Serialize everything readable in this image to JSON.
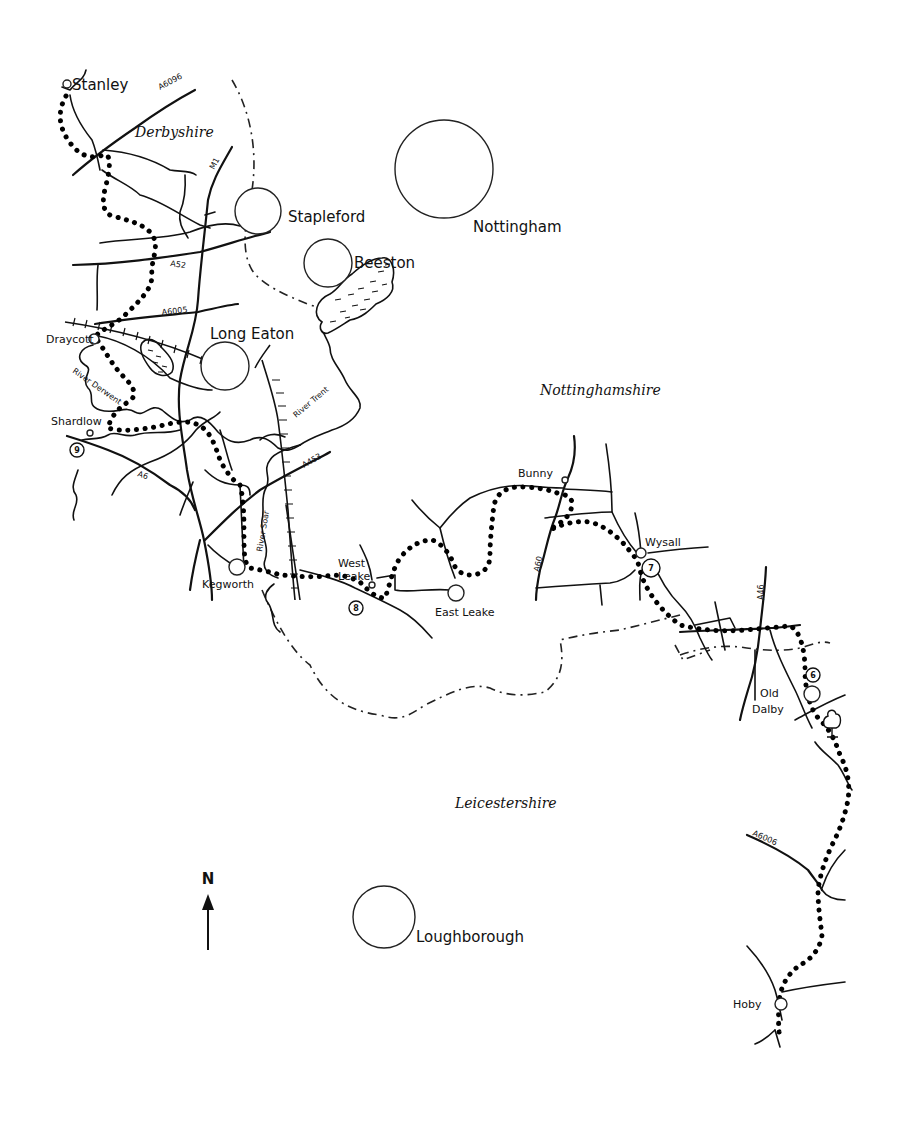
{
  "map": {
    "counties": {
      "derbyshire": "Derbyshire",
      "nottinghamshire": "Nottinghamshire",
      "leicestershire": "Leicestershire"
    },
    "towns": {
      "stanley": "Stanley",
      "stapleford": "Stapleford",
      "nottingham": "Nottingham",
      "beeston": "Beeston",
      "long_eaton": "Long Eaton",
      "draycott": "Draycott",
      "shardlow": "Shardlow",
      "kegworth": "Kegworth",
      "west_leake_1": "West",
      "west_leake_2": "Leake",
      "east_leake": "East Leake",
      "bunny": "Bunny",
      "wysall": "Wysall",
      "old_dalby_1": "Old",
      "old_dalby_2": "Dalby",
      "loughborough": "Loughborough",
      "hoby": "Hoby"
    },
    "roads": {
      "a6096": "A6096",
      "m1": "M1",
      "a52": "A52",
      "a6005": "A6005",
      "a6": "A6",
      "a453": "A453",
      "a60": "A60",
      "a46": "A46",
      "a6006": "A6006"
    },
    "rivers": {
      "derwent": "River Derwent",
      "trent": "River Trent",
      "soar": "River Soar"
    },
    "stages": {
      "s9": "9",
      "s8": "8",
      "s7": "7",
      "s6": "6"
    },
    "compass": {
      "north": "N"
    },
    "colors": {
      "ink": "#111111",
      "paper": "#ffffff"
    }
  }
}
